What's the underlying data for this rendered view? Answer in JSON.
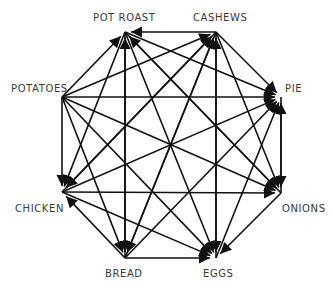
{
  "diagram": {
    "type": "directed-graph",
    "layout": "octagon",
    "edge_color": "#111111",
    "label_color": "#3a3a3a",
    "nodes": [
      {
        "id": "PR",
        "label": "POT ROAST",
        "x": 125,
        "y": 32,
        "lx": 93,
        "ly": 12
      },
      {
        "id": "CA",
        "label": "CASHEWS",
        "x": 216,
        "y": 32,
        "lx": 193,
        "ly": 12
      },
      {
        "id": "PI",
        "label": "PIE",
        "x": 281,
        "y": 97,
        "lx": 285,
        "ly": 83
      },
      {
        "id": "ON",
        "label": "ONIONS",
        "x": 281,
        "y": 193,
        "lx": 282,
        "ly": 203
      },
      {
        "id": "EG",
        "label": "EGGS",
        "x": 216,
        "y": 258,
        "lx": 203,
        "ly": 268
      },
      {
        "id": "BR",
        "label": "BREAD",
        "x": 125,
        "y": 258,
        "lx": 105,
        "ly": 268
      },
      {
        "id": "CH",
        "label": "CHICKEN",
        "x": 62,
        "y": 192,
        "lx": 15,
        "ly": 203
      },
      {
        "id": "PO",
        "label": "POTATOES",
        "x": 62,
        "y": 97,
        "lx": 11,
        "ly": 83
      }
    ],
    "edges": [
      {
        "from": "CA",
        "to": "PR"
      },
      {
        "from": "PO",
        "to": "PR"
      },
      {
        "from": "BR",
        "to": "PR"
      },
      {
        "from": "ON",
        "to": "PR"
      },
      {
        "from": "PO",
        "to": "CA"
      },
      {
        "from": "CH",
        "to": "CA"
      },
      {
        "from": "BR",
        "to": "CA"
      },
      {
        "from": "EG",
        "to": "CA"
      },
      {
        "from": "CA",
        "to": "PI"
      },
      {
        "from": "PR",
        "to": "PI"
      },
      {
        "from": "PO",
        "to": "PI"
      },
      {
        "from": "CH",
        "to": "PI"
      },
      {
        "from": "BR",
        "to": "PI"
      },
      {
        "from": "EG",
        "to": "PI"
      },
      {
        "from": "ON",
        "to": "PI"
      },
      {
        "from": "CA",
        "to": "ON"
      },
      {
        "from": "PR",
        "to": "ON"
      },
      {
        "from": "PO",
        "to": "ON"
      },
      {
        "from": "CH",
        "to": "ON"
      },
      {
        "from": "PR",
        "to": "EG"
      },
      {
        "from": "CA",
        "to": "EG"
      },
      {
        "from": "PO",
        "to": "EG"
      },
      {
        "from": "CH",
        "to": "EG"
      },
      {
        "from": "BR",
        "to": "EG"
      },
      {
        "from": "ON",
        "to": "EG"
      },
      {
        "from": "PO",
        "to": "BR"
      },
      {
        "from": "PR",
        "to": "BR"
      },
      {
        "from": "CA",
        "to": "BR"
      },
      {
        "from": "BR",
        "to": "CH"
      },
      {
        "from": "PO",
        "to": "CH"
      },
      {
        "from": "PR",
        "to": "CH"
      },
      {
        "from": "CA",
        "to": "CH"
      },
      {
        "from": "PI",
        "to": "ON"
      }
    ]
  }
}
